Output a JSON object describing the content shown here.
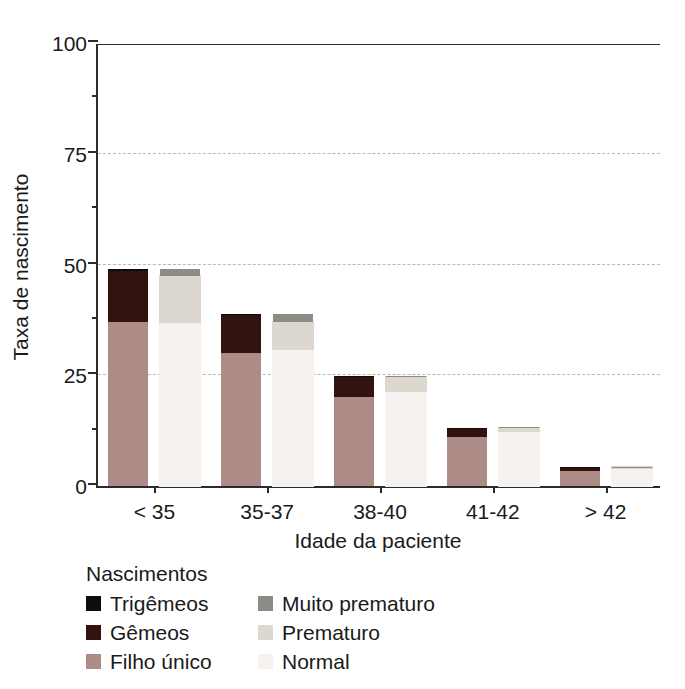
{
  "chart_data": {
    "type": "bar",
    "title": "",
    "subtitle": "",
    "xlabel": "Idade da paciente",
    "ylabel": "Taxa de nascimento",
    "categories": [
      "< 35",
      "35-37",
      "38-40",
      "41-42",
      "> 42"
    ],
    "ylim": [
      0,
      100
    ],
    "ytick_labels": [
      "0",
      "25",
      "50",
      "75",
      "100"
    ],
    "ytick_values": [
      0,
      25,
      50,
      75,
      100
    ],
    "yminor_values": [
      12.5,
      37.5,
      62.5,
      87.5
    ],
    "grid": "horizontal-dashed-at-25-50-75",
    "legend_position": "below-plot",
    "legend_title": "Nascimentos",
    "stacking": "stacked",
    "grouping": "two stacked bars per age category: multiplicity bar and prematurity bar",
    "series": [
      {
        "name": "Filho único",
        "group": "multiplicidade",
        "color": "#ad8b86",
        "values": [
          37.0,
          30.0,
          20.0,
          11.0,
          3.3
        ]
      },
      {
        "name": "Gêmeos",
        "group": "multiplicidade",
        "color": "#33130f",
        "values": [
          11.5,
          8.5,
          4.8,
          2.0,
          1.0
        ]
      },
      {
        "name": "Trigêmeos",
        "group": "multiplicidade",
        "color": "#0d0d0d",
        "values": [
          0.5,
          0.3,
          0.1,
          0.1,
          0.05
        ]
      },
      {
        "name": "Normal",
        "group": "prematuridade",
        "color": "#f5f2ef",
        "values": [
          37.0,
          31.0,
          21.5,
          12.5,
          4.0
        ]
      },
      {
        "name": "Prematuro",
        "group": "prematuridade",
        "color": "#dcd8d0",
        "values": [
          10.5,
          6.0,
          3.0,
          0.6,
          0.2
        ]
      },
      {
        "name": "Muito prematuro",
        "group": "prematuridade",
        "color": "#8d8c84",
        "values": [
          1.5,
          1.8,
          0.3,
          0.2,
          0.1
        ]
      }
    ],
    "totals": {
      "multiplicidade": [
        49.0,
        38.8,
        24.9,
        13.1,
        4.35
      ],
      "prematuridade": [
        49.0,
        38.8,
        24.8,
        13.3,
        4.3
      ]
    }
  },
  "axes": {
    "y": {
      "label": "Taxa de nascimento",
      "ticks": [
        {
          "value": 0,
          "label": "0"
        },
        {
          "value": 25,
          "label": "25"
        },
        {
          "value": 50,
          "label": "50"
        },
        {
          "value": 75,
          "label": "75"
        },
        {
          "value": 100,
          "label": "100"
        }
      ]
    },
    "x": {
      "label": "Idade da paciente",
      "ticks": [
        {
          "label": "< 35"
        },
        {
          "label": "35-37"
        },
        {
          "label": "38-40"
        },
        {
          "label": "41-42"
        },
        {
          "label": "> 42"
        }
      ]
    }
  },
  "legend": {
    "title": "Nascimentos",
    "columns": [
      {
        "items": [
          {
            "label": "Trigêmeos",
            "color": "#0d0d0d"
          },
          {
            "label": "Gêmeos",
            "color": "#33130f"
          },
          {
            "label": "Filho único",
            "color": "#ad8b86"
          }
        ]
      },
      {
        "items": [
          {
            "label": "Muito prematuro",
            "color": "#8d8c84"
          },
          {
            "label": "Prematuro",
            "color": "#dcd8d0"
          },
          {
            "label": "Normal",
            "color": "#f5f2ef"
          }
        ]
      }
    ]
  },
  "colors": {
    "axis": "#2b2b2b",
    "grid": "#b9b9b9",
    "text": "#1a1a1a",
    "background": "#ffffff"
  }
}
